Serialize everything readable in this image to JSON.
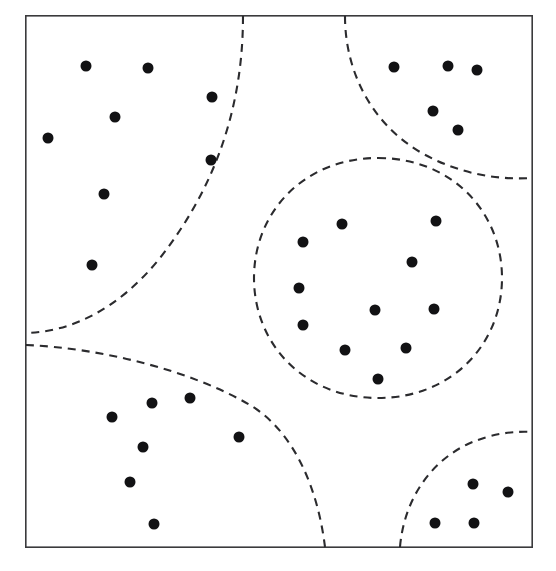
{
  "figure": {
    "background_color": "#ffffff",
    "frame": {
      "x": 25,
      "y": 15,
      "width": 508,
      "height": 533,
      "stroke_color": "#3a3a3c",
      "stroke_width": 1.6
    },
    "point_style": {
      "radius": 5.5,
      "fill_color": "#121214"
    },
    "boundary_style": {
      "stroke_color": "#2b2b2e",
      "stroke_width": 2.1,
      "dash_pattern": "8 6"
    }
  },
  "chart_data": {
    "type": "scatter",
    "xlabel": "",
    "ylabel": "",
    "xlim": [
      25,
      533
    ],
    "ylim": [
      15,
      548
    ],
    "grid": false,
    "legend": "none",
    "axis_ticks": "none",
    "cluster_count": 5,
    "point_count": 33,
    "series": [
      {
        "name": "top-left-cluster",
        "point_count": 7,
        "points": [
          {
            "x": 86,
            "y": 66
          },
          {
            "x": 148,
            "y": 68
          },
          {
            "x": 212,
            "y": 97
          },
          {
            "x": 115,
            "y": 117
          },
          {
            "x": 48,
            "y": 138
          },
          {
            "x": 211,
            "y": 160
          },
          {
            "x": 104,
            "y": 194
          },
          {
            "x": 92,
            "y": 265
          }
        ]
      },
      {
        "name": "top-right-cluster",
        "point_count": 5,
        "points": [
          {
            "x": 394,
            "y": 67
          },
          {
            "x": 448,
            "y": 66
          },
          {
            "x": 477,
            "y": 70
          },
          {
            "x": 433,
            "y": 111
          },
          {
            "x": 458,
            "y": 130
          }
        ]
      },
      {
        "name": "center-cluster",
        "point_count": 10,
        "points": [
          {
            "x": 342,
            "y": 224
          },
          {
            "x": 436,
            "y": 221
          },
          {
            "x": 303,
            "y": 242
          },
          {
            "x": 412,
            "y": 262
          },
          {
            "x": 299,
            "y": 288
          },
          {
            "x": 375,
            "y": 310
          },
          {
            "x": 434,
            "y": 309
          },
          {
            "x": 303,
            "y": 325
          },
          {
            "x": 345,
            "y": 350
          },
          {
            "x": 406,
            "y": 348
          },
          {
            "x": 378,
            "y": 379
          }
        ]
      },
      {
        "name": "bottom-left-cluster",
        "point_count": 7,
        "points": [
          {
            "x": 152,
            "y": 403
          },
          {
            "x": 190,
            "y": 398
          },
          {
            "x": 112,
            "y": 417
          },
          {
            "x": 239,
            "y": 437
          },
          {
            "x": 143,
            "y": 447
          },
          {
            "x": 130,
            "y": 482
          },
          {
            "x": 154,
            "y": 524
          }
        ]
      },
      {
        "name": "bottom-right-cluster",
        "point_count": 4,
        "points": [
          {
            "x": 473,
            "y": 484
          },
          {
            "x": 508,
            "y": 492
          },
          {
            "x": 435,
            "y": 523
          },
          {
            "x": 474,
            "y": 523
          }
        ]
      }
    ],
    "boundaries": [
      {
        "name": "top-left-boundary",
        "description": "Dashed arc from top edge curving down-left to the left edge, separating the top-left cluster"
      },
      {
        "name": "top-right-boundary",
        "description": "Dashed arc from top edge curving down-right to the right edge, separating the top-right cluster"
      },
      {
        "name": "center-boundary",
        "description": "Closed dashed circle enclosing the central cluster"
      },
      {
        "name": "bottom-left-boundary",
        "description": "Dashed arc from the left edge curving down-right to the bottom edge, separating the bottom-left cluster"
      },
      {
        "name": "bottom-right-boundary",
        "description": "Dashed arc from the bottom edge curving up-right to the right edge, separating the bottom-right cluster"
      }
    ]
  }
}
